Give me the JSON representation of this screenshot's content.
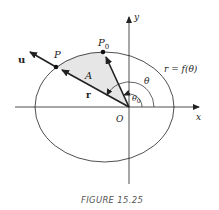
{
  "figure": {
    "caption": "FIGURE 15.25",
    "labels": {
      "x_axis": "x",
      "y_axis": "y",
      "origin": "O",
      "point_p": "P",
      "point_p0": "P",
      "point_p0_subscript": "0",
      "vector_u": "u",
      "vector_r": "r",
      "area": "A",
      "theta": "θ",
      "theta0": "θ",
      "theta0_subscript": "0",
      "curve_equation": "r = f(θ)"
    },
    "colors": {
      "stroke": "#222222",
      "shaded_area": "#e6e6e6",
      "caption": "#555555"
    }
  }
}
